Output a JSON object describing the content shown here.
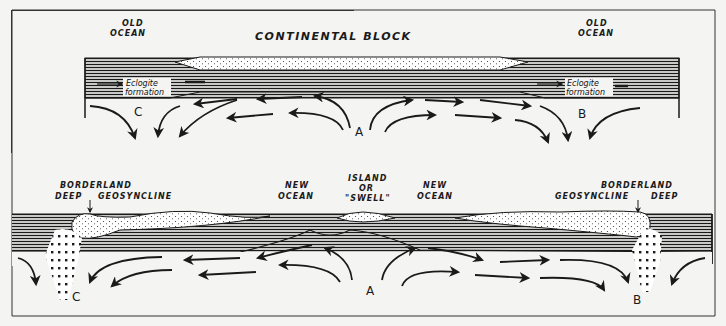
{
  "figure": {
    "colors": {
      "ink": "#1a1a1a",
      "paper": "#f4f4f2",
      "stipple": "#ffffff"
    }
  },
  "top_panel": {
    "title": "CONTINENTAL BLOCK",
    "left_label": [
      "OLD",
      "OCEAN"
    ],
    "right_label": [
      "OLD",
      "OCEAN"
    ],
    "eclogite_left": [
      "Eclogite",
      "formation"
    ],
    "eclogite_right": [
      "Eclogite",
      "formation"
    ],
    "points": {
      "a": "A",
      "b": "B",
      "c": "C"
    }
  },
  "bottom_panel": {
    "borderland_left": "BORDERLAND",
    "deep_left": "DEEP",
    "geosyncline_left": "GEOSYNCLINE",
    "new_ocean_left": [
      "NEW",
      "OCEAN"
    ],
    "island": [
      "ISLAND",
      "OR",
      "\"SWELL\""
    ],
    "new_ocean_right": [
      "NEW",
      "OCEAN"
    ],
    "borderland_right": "BORDERLAND",
    "geosyncline_right": "GEOSYNCLINE",
    "deep_right": "DEEP",
    "points": {
      "a": "A",
      "b": "B",
      "c": "C"
    }
  }
}
